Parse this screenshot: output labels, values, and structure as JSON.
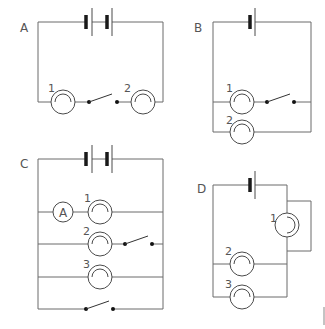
{
  "diagrams": [
    {
      "label": "A",
      "description": "Two cells in series with lamps 1 and 2 in series and an open switch between them",
      "lamps": [
        "1",
        "2"
      ]
    },
    {
      "label": "B",
      "description": "Single cell; lamp 1 in series with open switch, parallel with lamp 2",
      "lamps": [
        "1",
        "2"
      ]
    },
    {
      "label": "C",
      "description": "Two cells; ammeter with lamp 1, lamp 2 with open switch, lamp 3, and an open switch branch, all in parallel",
      "lamps": [
        "1",
        "2",
        "3"
      ],
      "ammeter": "A"
    },
    {
      "label": "D",
      "description": "Single cell; lamp 1 short-circuited by a wire loop, lamps 2 and 3 in parallel",
      "lamps": [
        "1",
        "2",
        "3"
      ]
    }
  ],
  "colors": {
    "wire": "#6b6b6b",
    "cell": "#1a1a1a",
    "background": "#ffffff"
  }
}
